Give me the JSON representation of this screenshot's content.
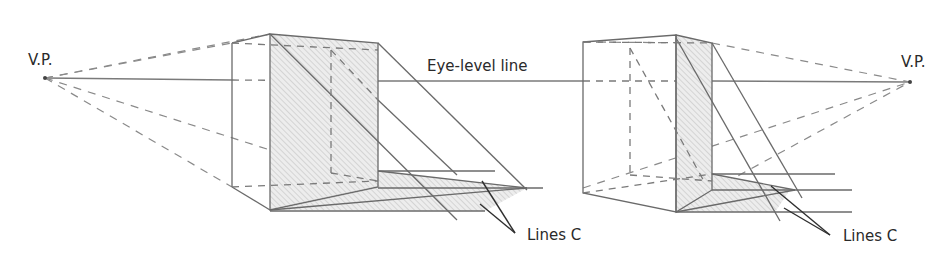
{
  "labels": {
    "vp_left": "V.P.",
    "vp_right": "V.P.",
    "eye_level": "Eye-level line",
    "lines_c_left": "Lines C",
    "lines_c_right": "Lines C"
  },
  "colors": {
    "line": "#6e6e6e",
    "dark_line": "#3a3a3a",
    "shade": "#d9d9d9",
    "background": "#ffffff"
  }
}
